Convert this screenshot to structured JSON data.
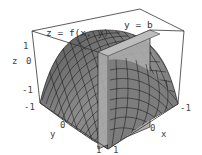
{
  "figure": {
    "type": "3d-surface-plot",
    "annotations": {
      "surface_label": "z = f(x, y)",
      "plane_label": "y = b"
    },
    "axes": {
      "x": {
        "label": "x",
        "ticks": [
          "-1",
          "0",
          "1"
        ]
      },
      "y": {
        "label": "y",
        "ticks": [
          "-1",
          "0",
          "1"
        ]
      },
      "z": {
        "label": "z",
        "ticks": [
          "-1",
          "0",
          "1"
        ]
      }
    },
    "colors": {
      "box": "#333333",
      "surface_fill": "#8a8a8a",
      "surface_mesh": "#111111",
      "plane_fill": "#a9a9a9",
      "plane_edge": "#222222",
      "text": "#444444"
    }
  }
}
